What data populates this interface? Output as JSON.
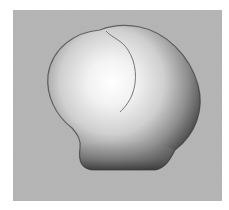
{
  "figure": {
    "colors": {
      "page_background": "#ffffff",
      "panel_background": "#b4b4b4",
      "highlight": "#ffffff",
      "midtone": "#c8c8c8",
      "shadow": "#5a5a5a",
      "edge": "#2e2e2e",
      "seam": "#6a6a6a"
    }
  }
}
